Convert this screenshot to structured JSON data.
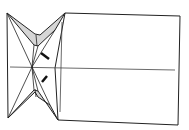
{
  "diagram": {
    "type": "origami-step",
    "colors": {
      "line": "#222222",
      "shade": "#d6d6d6",
      "paper": "#ffffff"
    }
  }
}
